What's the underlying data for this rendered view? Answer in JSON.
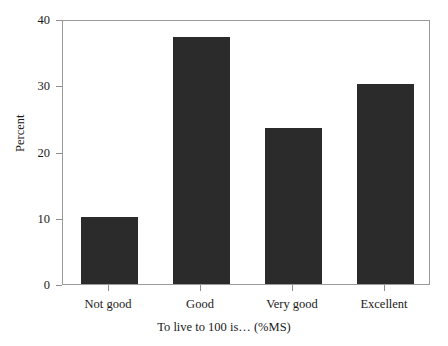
{
  "chart_data": {
    "type": "bar",
    "title": "",
    "categories": [
      "Not good",
      "Good",
      "Very good",
      "Excellent"
    ],
    "values": [
      10.1,
      37.3,
      23.6,
      30.2
    ],
    "xlabel": "To live to 100 is… (%MS)",
    "ylabel": "Percent",
    "ylim": [
      0,
      40
    ],
    "yticks": [
      0,
      10,
      20,
      30,
      40
    ],
    "ytick_labels": [
      "0",
      "10",
      "20",
      "30",
      "40"
    ],
    "grid": false,
    "legend": false,
    "bar_color": "#2b2b2b",
    "axis_color": "#9a9a9a",
    "background": "#ffffff"
  },
  "axes": {
    "y_title": "Percent",
    "x_title": "To live to 100 is… (%MS)"
  }
}
